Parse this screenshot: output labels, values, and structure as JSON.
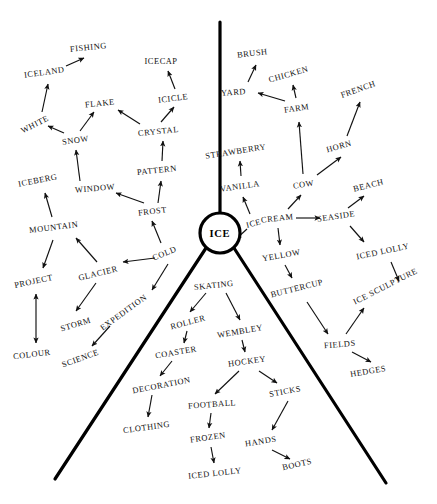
{
  "diagram": {
    "hub": {
      "label": "ICE",
      "cx": 220,
      "cy": 233,
      "r": 20
    },
    "colors": {
      "ink": "#111111",
      "line": "#000000",
      "background": "#ffffff"
    },
    "branch_lines": [
      {
        "name": "trunk-up",
        "x1": 220,
        "y1": 22,
        "x2": 220,
        "y2": 213
      },
      {
        "name": "branch-down-left",
        "x1": 206,
        "y1": 248,
        "x2": 55,
        "y2": 479
      },
      {
        "name": "branch-down-right",
        "x1": 234,
        "y1": 248,
        "x2": 386,
        "y2": 483
      }
    ],
    "nodes": [
      {
        "id": "ice",
        "label": "ICE",
        "x": 220,
        "y": 233,
        "rot": 0,
        "hub": true
      },
      {
        "id": "fishing",
        "label": "FISHING",
        "x": 88,
        "y": 47,
        "rot": -6
      },
      {
        "id": "iceland",
        "label": "ICELAND",
        "x": 44,
        "y": 72,
        "rot": -8
      },
      {
        "id": "white",
        "label": "WHITE",
        "x": 35,
        "y": 124,
        "rot": -27
      },
      {
        "id": "icecap",
        "label": "ICECAP",
        "x": 161,
        "y": 61,
        "rot": 0
      },
      {
        "id": "icicle",
        "label": "ICICLE",
        "x": 173,
        "y": 98,
        "rot": -7
      },
      {
        "id": "flake",
        "label": "FLAKE",
        "x": 100,
        "y": 103,
        "rot": -6
      },
      {
        "id": "snow",
        "label": "SNOW",
        "x": 75,
        "y": 140,
        "rot": -8
      },
      {
        "id": "crystal",
        "label": "CRYSTAL",
        "x": 158,
        "y": 131,
        "rot": -6
      },
      {
        "id": "iceberg",
        "label": "ICEBERG",
        "x": 38,
        "y": 180,
        "rot": -11
      },
      {
        "id": "window",
        "label": "WINDOW",
        "x": 95,
        "y": 188,
        "rot": -5
      },
      {
        "id": "pattern",
        "label": "PATTERN",
        "x": 157,
        "y": 170,
        "rot": -6
      },
      {
        "id": "frost",
        "label": "FROST",
        "x": 152,
        "y": 211,
        "rot": -7
      },
      {
        "id": "mountain",
        "label": "MOUNTAIN",
        "x": 53,
        "y": 227,
        "rot": -7
      },
      {
        "id": "cold",
        "label": "COLD",
        "x": 164,
        "y": 253,
        "rot": -22
      },
      {
        "id": "glacier",
        "label": "GLACIER",
        "x": 98,
        "y": 273,
        "rot": -14
      },
      {
        "id": "project",
        "label": "PROJECT",
        "x": 33,
        "y": 281,
        "rot": -12
      },
      {
        "id": "storm",
        "label": "STORM",
        "x": 75,
        "y": 324,
        "rot": -17
      },
      {
        "id": "expedition",
        "label": "EXPEDITION",
        "x": 123,
        "y": 312,
        "rot": -36
      },
      {
        "id": "colour",
        "label": "COLOUR",
        "x": 32,
        "y": 354,
        "rot": -7
      },
      {
        "id": "science",
        "label": "SCIENCE",
        "x": 80,
        "y": 358,
        "rot": -20
      },
      {
        "id": "brush",
        "label": "BRUSH",
        "x": 252,
        "y": 53,
        "rot": -7
      },
      {
        "id": "yard",
        "label": "YARD",
        "x": 233,
        "y": 92,
        "rot": -4
      },
      {
        "id": "chicken",
        "label": "CHICKEN",
        "x": 288,
        "y": 74,
        "rot": -16
      },
      {
        "id": "farm",
        "label": "FARM",
        "x": 296,
        "y": 108,
        "rot": -8
      },
      {
        "id": "french",
        "label": "FRENCH",
        "x": 358,
        "y": 89,
        "rot": -20
      },
      {
        "id": "strawberry",
        "label": "STRAWBERRY",
        "x": 236,
        "y": 151,
        "rot": -9
      },
      {
        "id": "horn",
        "label": "HORN",
        "x": 339,
        "y": 146,
        "rot": -16
      },
      {
        "id": "vanilla",
        "label": "VANILLA",
        "x": 240,
        "y": 186,
        "rot": -8
      },
      {
        "id": "cow",
        "label": "COW",
        "x": 303,
        "y": 184,
        "rot": -9
      },
      {
        "id": "beach",
        "label": "BEACH",
        "x": 368,
        "y": 185,
        "rot": -14
      },
      {
        "id": "ice2",
        "label": "ICE",
        "x": 253,
        "y": 223,
        "rot": -15
      },
      {
        "id": "cream",
        "label": "CREAM",
        "x": 277,
        "y": 218,
        "rot": -6
      },
      {
        "id": "seaside",
        "label": "SEASIDE",
        "x": 336,
        "y": 216,
        "rot": -8
      },
      {
        "id": "yellow",
        "label": "YELLOW",
        "x": 281,
        "y": 255,
        "rot": -10
      },
      {
        "id": "icedlolly1",
        "label": "ICED LOLLY",
        "x": 383,
        "y": 251,
        "rot": -12
      },
      {
        "id": "buttercup",
        "label": "BUTTERCUP",
        "x": 297,
        "y": 288,
        "rot": -14
      },
      {
        "id": "icesculpture",
        "label": "ICE SCULPTURE",
        "x": 385,
        "y": 286,
        "rot": -27
      },
      {
        "id": "fields",
        "label": "FIELDS",
        "x": 340,
        "y": 344,
        "rot": -5
      },
      {
        "id": "hedges",
        "label": "HEDGES",
        "x": 368,
        "y": 371,
        "rot": -10
      },
      {
        "id": "skating",
        "label": "SKATING",
        "x": 214,
        "y": 285,
        "rot": -6
      },
      {
        "id": "roller",
        "label": "ROLLER",
        "x": 188,
        "y": 322,
        "rot": -15
      },
      {
        "id": "wembley",
        "label": "WEMBLEY",
        "x": 240,
        "y": 331,
        "rot": -10
      },
      {
        "id": "coaster",
        "label": "COASTER",
        "x": 176,
        "y": 352,
        "rot": -10
      },
      {
        "id": "hockey",
        "label": "HOCKEY",
        "x": 247,
        "y": 361,
        "rot": -8
      },
      {
        "id": "decoration",
        "label": "DECORATION",
        "x": 161,
        "y": 385,
        "rot": -11
      },
      {
        "id": "football",
        "label": "FOOTBALL",
        "x": 212,
        "y": 404,
        "rot": -4
      },
      {
        "id": "sticks",
        "label": "STICKS",
        "x": 285,
        "y": 391,
        "rot": -11
      },
      {
        "id": "clothing",
        "label": "CLOTHING",
        "x": 146,
        "y": 427,
        "rot": -8
      },
      {
        "id": "frozen",
        "label": "FROZEN",
        "x": 208,
        "y": 437,
        "rot": -8
      },
      {
        "id": "hands",
        "label": "HANDS",
        "x": 261,
        "y": 441,
        "rot": -9
      },
      {
        "id": "boots",
        "label": "BOOTS",
        "x": 297,
        "y": 464,
        "rot": -13
      },
      {
        "id": "icedlolly2",
        "label": "ICED LOLLY",
        "x": 215,
        "y": 473,
        "rot": -6
      }
    ],
    "edges": [
      {
        "from": "iceland",
        "to": "fishing",
        "x1": 66,
        "y1": 66,
        "x2": 84,
        "y2": 58,
        "double": false
      },
      {
        "from": "white",
        "to": "iceland",
        "x1": 42,
        "y1": 112,
        "x2": 48,
        "y2": 84,
        "double": false
      },
      {
        "from": "snow",
        "to": "white",
        "x1": 64,
        "y1": 133,
        "x2": 48,
        "y2": 126,
        "double": false
      },
      {
        "from": "snow",
        "to": "flake",
        "x1": 80,
        "y1": 131,
        "x2": 94,
        "y2": 112,
        "double": false
      },
      {
        "from": "window",
        "to": "snow",
        "x1": 80,
        "y1": 181,
        "x2": 76,
        "y2": 150,
        "double": false
      },
      {
        "from": "crystal",
        "to": "flake",
        "x1": 140,
        "y1": 124,
        "x2": 118,
        "y2": 110,
        "double": false
      },
      {
        "from": "crystal",
        "to": "icicle",
        "x1": 161,
        "y1": 122,
        "x2": 174,
        "y2": 107,
        "double": false
      },
      {
        "from": "icicle",
        "to": "icecap",
        "x1": 175,
        "y1": 89,
        "x2": 168,
        "y2": 71,
        "double": false
      },
      {
        "from": "pattern",
        "to": "crystal",
        "x1": 162,
        "y1": 161,
        "x2": 163,
        "y2": 141,
        "double": false
      },
      {
        "from": "frost",
        "to": "pattern",
        "x1": 158,
        "y1": 203,
        "x2": 161,
        "y2": 181,
        "double": false
      },
      {
        "from": "frost",
        "to": "window",
        "x1": 144,
        "y1": 203,
        "x2": 116,
        "y2": 193,
        "double": false
      },
      {
        "from": "cold",
        "to": "frost",
        "x1": 161,
        "y1": 243,
        "x2": 152,
        "y2": 221,
        "double": false
      },
      {
        "from": "cold",
        "to": "glacier",
        "x1": 155,
        "y1": 258,
        "x2": 123,
        "y2": 262,
        "double": false
      },
      {
        "from": "cold",
        "to": "expedition",
        "x1": 168,
        "y1": 264,
        "x2": 152,
        "y2": 290,
        "double": false
      },
      {
        "from": "mountain",
        "to": "iceberg",
        "x1": 52,
        "y1": 217,
        "x2": 45,
        "y2": 193,
        "double": false
      },
      {
        "from": "glacier",
        "to": "mountain",
        "x1": 97,
        "y1": 262,
        "x2": 76,
        "y2": 238,
        "double": false
      },
      {
        "from": "mountain",
        "to": "project",
        "x1": 53,
        "y1": 240,
        "x2": 43,
        "y2": 268,
        "double": false
      },
      {
        "from": "glacier",
        "to": "storm",
        "x1": 96,
        "y1": 283,
        "x2": 76,
        "y2": 311,
        "double": false
      },
      {
        "from": "expedition",
        "to": "science",
        "x1": 110,
        "y1": 326,
        "x2": 92,
        "y2": 346,
        "double": false
      },
      {
        "from": "project",
        "to": "colour",
        "x1": 36,
        "y1": 294,
        "x2": 36,
        "y2": 343,
        "double": true
      },
      {
        "from": "yard",
        "to": "brush",
        "x1": 248,
        "y1": 82,
        "x2": 256,
        "y2": 65,
        "double": false
      },
      {
        "from": "farm",
        "to": "yard",
        "x1": 285,
        "y1": 101,
        "x2": 258,
        "y2": 93,
        "double": false
      },
      {
        "from": "farm",
        "to": "chicken",
        "x1": 296,
        "y1": 98,
        "x2": 293,
        "y2": 85,
        "double": false
      },
      {
        "from": "cow",
        "to": "farm",
        "x1": 303,
        "y1": 174,
        "x2": 299,
        "y2": 122,
        "double": false
      },
      {
        "from": "cow",
        "to": "horn",
        "x1": 317,
        "y1": 175,
        "x2": 341,
        "y2": 157,
        "double": false
      },
      {
        "from": "horn",
        "to": "french",
        "x1": 347,
        "y1": 136,
        "x2": 360,
        "y2": 102,
        "double": false
      },
      {
        "from": "vanilla",
        "to": "strawberry",
        "x1": 241,
        "y1": 176,
        "x2": 240,
        "y2": 161,
        "double": false
      },
      {
        "from": "ice2",
        "to": "vanilla",
        "x1": 250,
        "y1": 214,
        "x2": 243,
        "y2": 197,
        "double": false
      },
      {
        "from": "ice2",
        "to": "hub",
        "x1": 247,
        "y1": 229,
        "x2": 236,
        "y2": 239,
        "double": false
      },
      {
        "from": "cream",
        "to": "cow",
        "x1": 288,
        "y1": 209,
        "x2": 301,
        "y2": 195,
        "double": false
      },
      {
        "from": "cream",
        "to": "seaside",
        "x1": 296,
        "y1": 218,
        "x2": 320,
        "y2": 218,
        "double": false
      },
      {
        "from": "cream",
        "to": "yellow",
        "x1": 278,
        "y1": 228,
        "x2": 280,
        "y2": 245,
        "double": false
      },
      {
        "from": "seaside",
        "to": "beach",
        "x1": 348,
        "y1": 208,
        "x2": 364,
        "y2": 196,
        "double": false
      },
      {
        "from": "seaside",
        "to": "icedlolly1",
        "x1": 350,
        "y1": 226,
        "x2": 364,
        "y2": 242,
        "double": false
      },
      {
        "from": "yellow",
        "to": "buttercup",
        "x1": 285,
        "y1": 265,
        "x2": 292,
        "y2": 278,
        "double": false
      },
      {
        "from": "buttercup",
        "to": "fields",
        "x1": 307,
        "y1": 302,
        "x2": 328,
        "y2": 334,
        "double": false
      },
      {
        "from": "fields",
        "to": "icesculpture",
        "x1": 346,
        "y1": 334,
        "x2": 364,
        "y2": 308,
        "double": false
      },
      {
        "from": "icedlolly1",
        "to": "icesculpture",
        "x1": 391,
        "y1": 262,
        "x2": 399,
        "y2": 281,
        "double": false
      },
      {
        "from": "fields",
        "to": "hedges",
        "x1": 352,
        "y1": 352,
        "x2": 371,
        "y2": 362,
        "double": false
      },
      {
        "from": "skating",
        "to": "roller",
        "x1": 206,
        "y1": 293,
        "x2": 190,
        "y2": 312,
        "double": false
      },
      {
        "from": "skating",
        "to": "wembley",
        "x1": 226,
        "y1": 293,
        "x2": 240,
        "y2": 320,
        "double": false
      },
      {
        "from": "roller",
        "to": "coaster",
        "x1": 187,
        "y1": 331,
        "x2": 184,
        "y2": 343,
        "double": false
      },
      {
        "from": "wembley",
        "to": "hockey",
        "x1": 242,
        "y1": 340,
        "x2": 245,
        "y2": 352,
        "double": false
      },
      {
        "from": "coaster",
        "to": "decoration",
        "x1": 172,
        "y1": 361,
        "x2": 160,
        "y2": 376,
        "double": false
      },
      {
        "from": "hockey",
        "to": "football",
        "x1": 239,
        "y1": 371,
        "x2": 215,
        "y2": 394,
        "double": false
      },
      {
        "from": "hockey",
        "to": "sticks",
        "x1": 259,
        "y1": 371,
        "x2": 277,
        "y2": 383,
        "double": false
      },
      {
        "from": "decoration",
        "to": "clothing",
        "x1": 152,
        "y1": 395,
        "x2": 148,
        "y2": 417,
        "double": false
      },
      {
        "from": "football",
        "to": "frozen",
        "x1": 211,
        "y1": 413,
        "x2": 209,
        "y2": 428,
        "double": false
      },
      {
        "from": "sticks",
        "to": "hands",
        "x1": 288,
        "y1": 401,
        "x2": 272,
        "y2": 430,
        "double": false
      },
      {
        "from": "frozen",
        "to": "icedlolly2",
        "x1": 211,
        "y1": 447,
        "x2": 214,
        "y2": 463,
        "double": false
      },
      {
        "from": "hands",
        "to": "boots",
        "x1": 272,
        "y1": 450,
        "x2": 290,
        "y2": 459,
        "double": false
      }
    ]
  }
}
